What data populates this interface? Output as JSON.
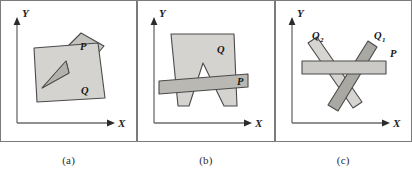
{
  "figure": {
    "panel_count": 3,
    "background_color": "#ffffff",
    "frame_color": "#7b7b7b"
  },
  "axes": {
    "x_label": "X",
    "y_label": "Y",
    "axis_color": "#6b6b6b",
    "arrow_color": "#2b2b2b"
  },
  "colors": {
    "fill_light": "#d4d3cf",
    "fill_mid": "#c3c2be",
    "fill_dark": "#a9a8a3",
    "notch_fill": "#b2b1ac",
    "outline": "#4a4a4a"
  },
  "panels": [
    {
      "caption": "(a)",
      "name": "panel-a",
      "shapes": [
        {
          "id": "Q",
          "label": "Q",
          "role": "concave-polygon-with-notch",
          "fill": "#d4d3cf",
          "label_x": 79,
          "label_y": 93
        },
        {
          "id": "P",
          "label": "P",
          "role": "quadrilateral",
          "fill": "#c3c2be",
          "label_x": 80,
          "label_y": 48
        }
      ]
    },
    {
      "caption": "(b)",
      "name": "panel-b",
      "shapes": [
        {
          "id": "Q",
          "label": "Q",
          "role": "polygon-with-v-notch",
          "fill": "#d4d3cf",
          "label_x": 80,
          "label_y": 50
        },
        {
          "id": "P",
          "label": "P",
          "role": "horizontal-bar",
          "fill": "#b9b8b3",
          "label_x": 103,
          "label_y": 80
        }
      ]
    },
    {
      "caption": "(c)",
      "name": "panel-c",
      "shapes": [
        {
          "id": "Q2",
          "label": "Q",
          "subscript": "2",
          "role": "tilted-bar-left",
          "fill": "#d6d5d1",
          "label_x": 39,
          "label_y": 36
        },
        {
          "id": "Q1",
          "label": "Q",
          "subscript": "1",
          "role": "tilted-bar-right",
          "fill": "#a9a8a3",
          "label_x": 101,
          "label_y": 36
        },
        {
          "id": "P",
          "label": "P",
          "role": "horizontal-bar",
          "fill": "#cbcac6",
          "label_x": 116,
          "label_y": 54
        }
      ]
    }
  ]
}
